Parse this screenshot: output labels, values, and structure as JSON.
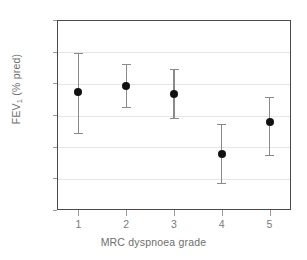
{
  "chart_data": {
    "type": "scatter",
    "title": "",
    "xlabel": "MRC dyspnoea grade",
    "ylabel": "FEV1 (% pred)",
    "ylabel_main": "FEV",
    "ylabel_sub": "1",
    "ylabel_tail": " (% pred)",
    "categories": [
      "1",
      "2",
      "3",
      "4",
      "5"
    ],
    "x": [
      1,
      2,
      3,
      4,
      5
    ],
    "values": [
      57.3,
      59.2,
      56.6,
      37.7,
      47.8
    ],
    "error_upper": [
      69.6,
      66.1,
      64.5,
      47.2,
      55.7
    ],
    "error_lower": [
      44.3,
      52.5,
      49.1,
      28.5,
      37.4
    ],
    "ylim": [
      20,
      80
    ],
    "yticks": [
      20,
      30,
      40,
      50,
      60,
      70,
      80
    ],
    "ytick_labels": [
      "20",
      "30",
      "40",
      "50",
      "60",
      "70",
      "80"
    ],
    "xlim": [
      0.55,
      5.45
    ],
    "grid": "horizontal",
    "legend": "none",
    "marker_color": "#111111",
    "errorbar_color": "#8a8a8a",
    "gridline_color": "#e6e6e6",
    "axis_color": "#4a4a4a",
    "background_color": "#ffffff"
  }
}
